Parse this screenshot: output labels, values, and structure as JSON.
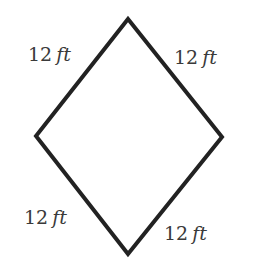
{
  "diagram": {
    "shape": "rhombus",
    "stroke_color": "#222222",
    "vertices": {
      "top": [
        128,
        19
      ],
      "right": [
        222,
        137
      ],
      "bottom": [
        128,
        254
      ],
      "left": [
        36,
        136
      ]
    },
    "sides": [
      {
        "id": "top-left",
        "number": "12",
        "unit": "ft"
      },
      {
        "id": "top-right",
        "number": "12",
        "unit": "ft"
      },
      {
        "id": "bottom-left",
        "number": "12",
        "unit": "ft"
      },
      {
        "id": "bottom-right",
        "number": "12",
        "unit": "ft"
      }
    ]
  }
}
